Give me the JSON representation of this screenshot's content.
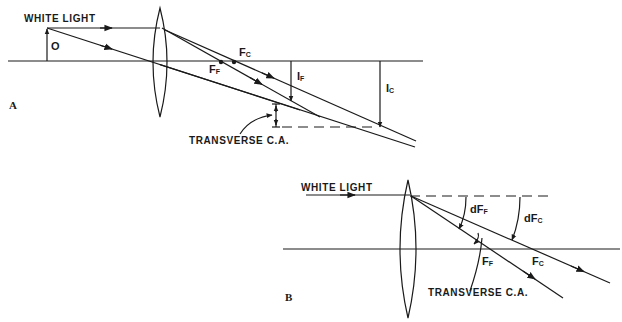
{
  "diagram": {
    "panel_a": {
      "panel_label": "A",
      "input_label": "WHITE LIGHT",
      "object_label": "O",
      "focus_f_label": "F",
      "focus_f_sub": "F",
      "focus_c_label": "F",
      "focus_c_sub": "C",
      "image_f_label": "I",
      "image_f_sub": "F",
      "image_c_label": "I",
      "image_c_sub": "C",
      "aberration_label": "TRANSVERSE C.A."
    },
    "panel_b": {
      "panel_label": "B",
      "input_label": "WHITE LIGHT",
      "angle_f_label": "dF",
      "angle_f_sub": "F",
      "angle_c_label": "dF",
      "angle_c_sub": "C",
      "focus_f_label": "F",
      "focus_f_sub": "F",
      "focus_c_label": "F",
      "focus_c_sub": "C",
      "aberration_label": "TRANSVERSE C.A."
    },
    "colors": {
      "ink": "#1a1a1a",
      "background": "#ffffff"
    }
  }
}
